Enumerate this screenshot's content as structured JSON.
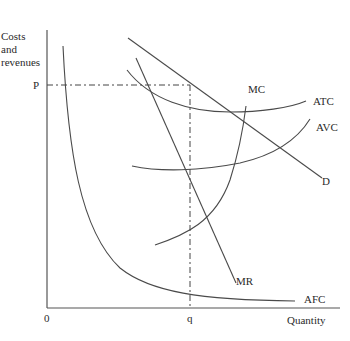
{
  "diagram": {
    "type": "monopolistic competition / monopoly cost and revenue diagram",
    "y_axis_label_lines": [
      "Costs",
      "and",
      "revenues"
    ],
    "x_axis_label": "Quantity",
    "origin_label": "0",
    "price_label": "P",
    "quantity_label": "q",
    "curves": {
      "mc": "MC",
      "atc": "ATC",
      "avc": "AVC",
      "d": "D",
      "mr": "MR",
      "afc": "AFC"
    }
  }
}
